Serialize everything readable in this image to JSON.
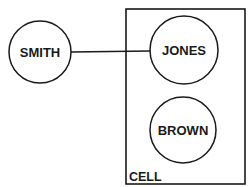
{
  "diagram": {
    "colors": {
      "stroke": "#1a1a1a",
      "background": "#ffffff",
      "text": "#1a1a1a"
    },
    "container": {
      "label": "CELL",
      "x": 126,
      "y": 9,
      "width": 119,
      "height": 175
    },
    "nodes": [
      {
        "id": "smith",
        "label": "SMITH",
        "cx": 40,
        "cy": 52,
        "r": 31
      },
      {
        "id": "jones",
        "label": "JONES",
        "cx": 184,
        "cy": 50,
        "r": 34
      },
      {
        "id": "brown",
        "label": "BROWN",
        "cx": 183,
        "cy": 130,
        "r": 33
      }
    ],
    "edges": [
      {
        "from": "smith",
        "to": "jones"
      }
    ]
  }
}
